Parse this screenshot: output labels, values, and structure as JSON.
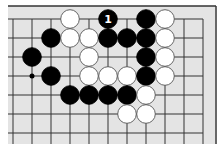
{
  "diagram": {
    "colors": {
      "board": "#e4e4e4",
      "line": "#333333",
      "black_stone": "#000000",
      "white_stone": "#ffffff",
      "stone_outline": "#555555",
      "label_on_black": "#ffffff"
    },
    "grid": {
      "x0": 13,
      "y0": 19,
      "spacing": 19,
      "cols": 11,
      "rows": 7
    },
    "stones": [
      {
        "color": "white",
        "col": 3,
        "row": 0
      },
      {
        "color": "black",
        "col": 5,
        "row": 0,
        "label": "1"
      },
      {
        "color": "black",
        "col": 7,
        "row": 0
      },
      {
        "color": "white",
        "col": 8,
        "row": 0
      },
      {
        "color": "black",
        "col": 2,
        "row": 1
      },
      {
        "color": "white",
        "col": 3,
        "row": 1
      },
      {
        "color": "white",
        "col": 4,
        "row": 1
      },
      {
        "color": "black",
        "col": 5,
        "row": 1
      },
      {
        "color": "black",
        "col": 6,
        "row": 1
      },
      {
        "color": "black",
        "col": 7,
        "row": 1
      },
      {
        "color": "white",
        "col": 8,
        "row": 1
      },
      {
        "color": "black",
        "col": 1,
        "row": 2
      },
      {
        "color": "white",
        "col": 4,
        "row": 2
      },
      {
        "color": "black",
        "col": 7,
        "row": 2
      },
      {
        "color": "white",
        "col": 8,
        "row": 2
      },
      {
        "color": "black",
        "col": 2,
        "row": 3
      },
      {
        "color": "white",
        "col": 4,
        "row": 3
      },
      {
        "color": "white",
        "col": 5,
        "row": 3
      },
      {
        "color": "white",
        "col": 6,
        "row": 3
      },
      {
        "color": "black",
        "col": 7,
        "row": 3
      },
      {
        "color": "white",
        "col": 8,
        "row": 3
      },
      {
        "color": "black",
        "col": 3,
        "row": 4
      },
      {
        "color": "black",
        "col": 4,
        "row": 4
      },
      {
        "color": "black",
        "col": 5,
        "row": 4
      },
      {
        "color": "black",
        "col": 6,
        "row": 4
      },
      {
        "color": "white",
        "col": 7,
        "row": 4
      },
      {
        "color": "white",
        "col": 6,
        "row": 5
      },
      {
        "color": "white",
        "col": 7,
        "row": 5
      }
    ],
    "markers": [
      {
        "type": "small-black-dot",
        "col": 1,
        "row": 3
      }
    ]
  }
}
